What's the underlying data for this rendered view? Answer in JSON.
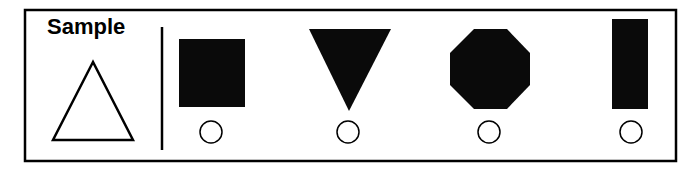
{
  "sample": {
    "label": "Sample",
    "shape": "triangle-outline"
  },
  "options": [
    {
      "shape": "filled-square",
      "selected": false
    },
    {
      "shape": "filled-inverted-triangle",
      "selected": false
    },
    {
      "shape": "filled-octagon",
      "selected": false
    },
    {
      "shape": "filled-tall-rectangle",
      "selected": false
    }
  ],
  "colors": {
    "ink": "#000000",
    "background": "#ffffff"
  }
}
